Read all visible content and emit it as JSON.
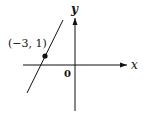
{
  "diagram": {
    "type": "coordinate-plane-line",
    "axes": {
      "x_label": "x",
      "y_label": "y",
      "origin_label": "0"
    },
    "point": {
      "label": "(−3, 1)",
      "x": -3,
      "y": 1
    },
    "line": {
      "description": "line with positive slope passing through (-3, 1)"
    },
    "colors": {
      "ink": "#111111",
      "background": "#ffffff"
    }
  }
}
